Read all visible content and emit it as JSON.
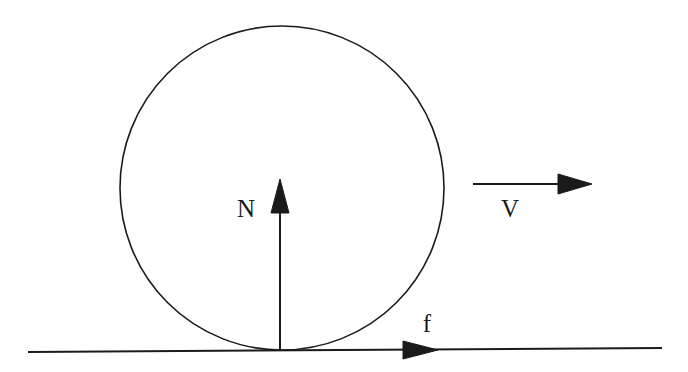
{
  "canvas": {
    "width": 688,
    "height": 372,
    "background_color": "#ffffff",
    "ink_color": "#1b1b1b"
  },
  "figure": {
    "type": "free-body-diagram"
  },
  "shapes": {
    "wheel": {
      "name": "wheel-circle",
      "center_x": 282,
      "center_y": 188,
      "radius": 162,
      "stroke_width": 1.6,
      "fill": "none"
    },
    "ground": {
      "name": "ground-line",
      "x1": 28,
      "y1": 352,
      "x2": 662,
      "y2": 348,
      "stroke_width": 2.0
    }
  },
  "vectors": [
    {
      "id": "normal-force",
      "label": "N",
      "label_x": 246,
      "label_y": 217,
      "shaft_x1": 280,
      "shaft_y1": 351,
      "shaft_x2": 280,
      "shaft_y2": 211,
      "head_tip_x": 280,
      "head_tip_y": 179,
      "head_base_y": 213,
      "head_half_width": 9,
      "direction": "up",
      "stroke_width": 2.0
    },
    {
      "id": "friction-force",
      "label": "f",
      "label_x": 427,
      "label_y": 332,
      "shaft_x1": 28,
      "shaft_y1": 350,
      "shaft_x2": 405,
      "shaft_y2": 350,
      "head_tip_x": 438,
      "head_tip_y": 350,
      "head_base_x": 403,
      "head_half_height": 9,
      "direction": "right",
      "stroke_width": 2.0
    },
    {
      "id": "velocity",
      "label": "V",
      "label_x": 510,
      "label_y": 217,
      "shaft_x1": 473,
      "shaft_y1": 184,
      "shaft_x2": 560,
      "shaft_y2": 184,
      "head_tip_x": 592,
      "head_tip_y": 184,
      "head_base_x": 558,
      "head_half_height": 10,
      "direction": "right",
      "stroke_width": 2.0
    }
  ],
  "labels": {
    "normal": "N",
    "friction": "f",
    "velocity": "V"
  }
}
